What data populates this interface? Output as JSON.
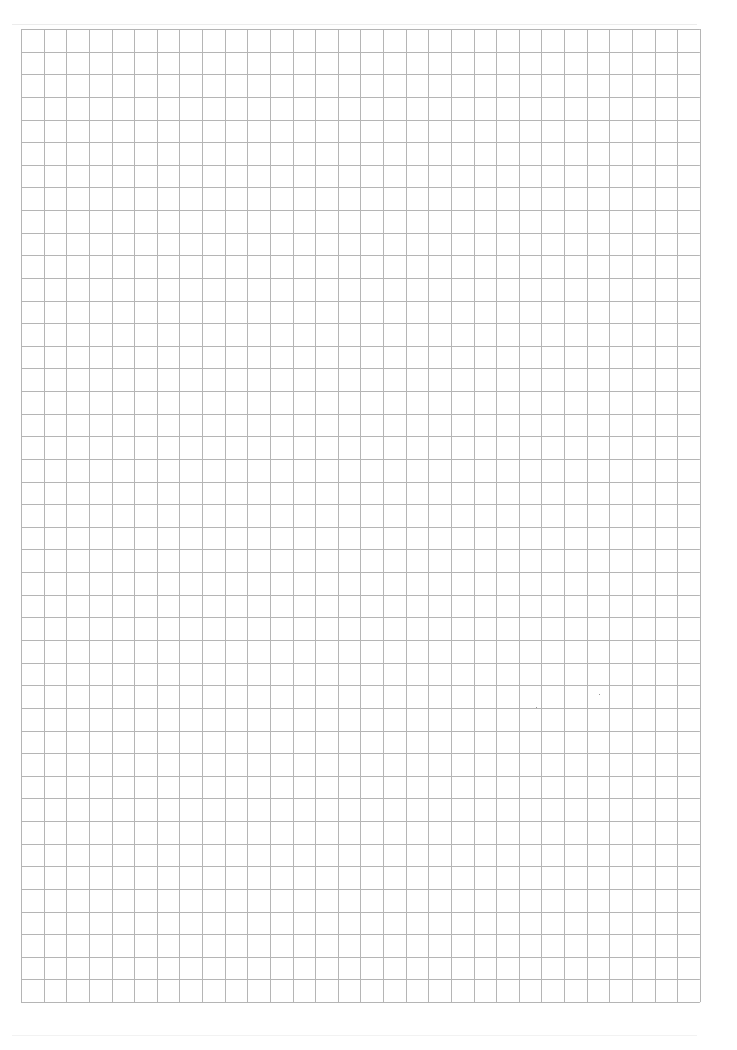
{
  "document": {
    "type": "graph-paper",
    "description": "Blank square-grid graph paper",
    "columns": 30,
    "rows": 43,
    "line_color": "#b5b5b5",
    "paper_color": "#ffffff"
  }
}
